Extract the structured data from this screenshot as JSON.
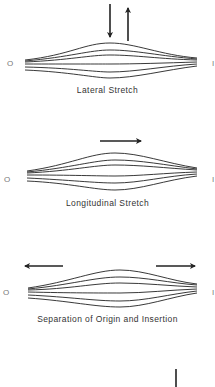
{
  "panels": [
    {
      "id": "lateral",
      "caption": "Lateral Stretch",
      "origin_label": "O",
      "insertion_label": "I",
      "arrows": [
        "down",
        "up"
      ]
    },
    {
      "id": "longitudinal",
      "caption": "Longitudinal Stretch",
      "origin_label": "O",
      "insertion_label": "I",
      "arrows": [
        "right"
      ]
    },
    {
      "id": "separation",
      "caption": "Separation of Origin and Insertion",
      "origin_label": "O",
      "insertion_label": "I",
      "arrows": [
        "left",
        "right"
      ]
    }
  ],
  "colors": {
    "line": "#222222",
    "text": "#333333",
    "background": "#ffffff"
  }
}
